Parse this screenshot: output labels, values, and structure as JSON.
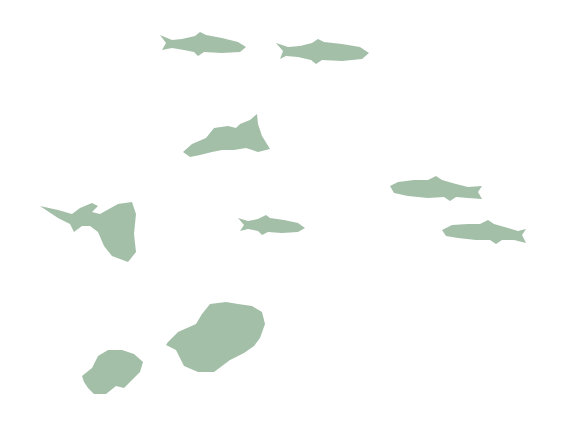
{
  "image": {
    "description": "Illustration of green fish silhouettes on a white background",
    "background": "#ffffff",
    "silhouette_color": "#a3bfa8",
    "fish_count": 10,
    "fish": [
      {
        "id": "slender-1",
        "type": "slender fish",
        "facing": "right"
      },
      {
        "id": "slender-2",
        "type": "slender fish",
        "facing": "right"
      },
      {
        "id": "guppy-male-1",
        "type": "guppy with raised tail",
        "facing": "left"
      },
      {
        "id": "guppy-male-2",
        "type": "guppy with fan tail",
        "facing": "left"
      },
      {
        "id": "slender-3",
        "type": "small slender fish",
        "facing": "right"
      },
      {
        "id": "slender-4",
        "type": "slender fish",
        "facing": "left"
      },
      {
        "id": "slender-5",
        "type": "slender fish",
        "facing": "left"
      },
      {
        "id": "blob-large",
        "type": "fancy-finned fish",
        "facing": "left"
      },
      {
        "id": "blob-small",
        "type": "fancy-finned fish",
        "facing": "left"
      }
    ]
  }
}
